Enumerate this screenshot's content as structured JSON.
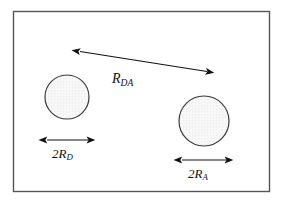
{
  "figure": {
    "background_color": "#ffffff",
    "frame": {
      "stroke_color": "#555555",
      "fill_color": "#ffffff",
      "x": 13,
      "y": 11,
      "width": 257,
      "height": 181
    },
    "circles": [
      {
        "name": "donor-circle",
        "cx": 67,
        "cy": 97,
        "r": 22,
        "stroke_color": "#3a3a3a",
        "fill_color": "#f7f7f7",
        "texture": "stipple-dots"
      },
      {
        "name": "acceptor-circle",
        "cx": 204,
        "cy": 121,
        "r": 25,
        "stroke_color": "#3a3a3a",
        "fill_color": "#f7f7f7",
        "texture": "stipple-dots"
      }
    ],
    "arrows": [
      {
        "name": "separation-arrow",
        "x1": 78,
        "y1": 51,
        "x2": 209,
        "y2": 72,
        "double_headed": true,
        "stroke_color": "#111111"
      },
      {
        "name": "donor-diameter-arrow",
        "x1": 45,
        "y1": 140,
        "x2": 90,
        "y2": 140,
        "double_headed": true,
        "stroke_color": "#111111"
      },
      {
        "name": "acceptor-diameter-arrow",
        "x1": 180,
        "y1": 160,
        "x2": 228,
        "y2": 160,
        "double_headed": true,
        "stroke_color": "#111111"
      }
    ],
    "labels": {
      "separation": {
        "symbol": "R",
        "subscript": "DA",
        "prefix": ""
      },
      "donor_diameter": {
        "symbol": "R",
        "subscript": "D",
        "prefix": "2"
      },
      "acceptor_diameter": {
        "symbol": "R",
        "subscript": "A",
        "prefix": "2"
      }
    }
  }
}
